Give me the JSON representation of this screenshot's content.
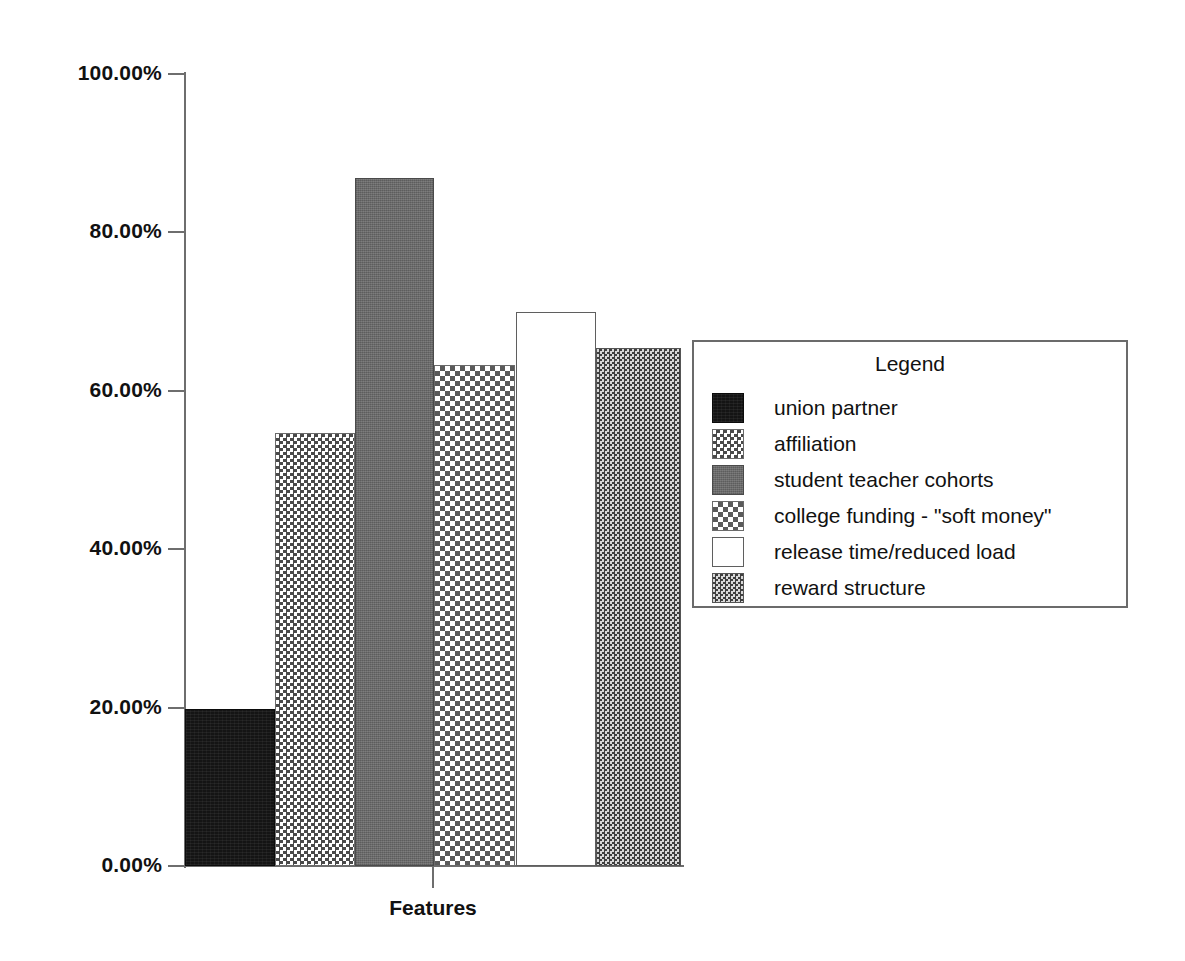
{
  "chart_data": {
    "type": "bar",
    "title": "",
    "xlabel": "Features",
    "ylabel": "% of PDSs",
    "ylim": [
      0,
      100
    ],
    "grid": false,
    "legend_position": "right",
    "legend_title": "Legend",
    "y_tick_labels": [
      "100.00%",
      "80.00%",
      "60.00%",
      "40.00%",
      "20.00%",
      "0.00%"
    ],
    "y_tick_values": [
      100,
      80,
      60,
      40,
      20,
      0
    ],
    "categories": [
      "union partner",
      "affiliation",
      "student teacher cohorts",
      "college funding - \"soft money\"",
      "release time/reduced load",
      "reward structure"
    ],
    "values": [
      19.8,
      54.7,
      86.9,
      63.3,
      69.9,
      65.4
    ],
    "value_labels": [
      "19.80%",
      "54.70%",
      "86.90%",
      "63.30%",
      "69.90%",
      "65.40%"
    ],
    "series": [
      {
        "name": "% of PDSs",
        "values": [
          19.8,
          54.7,
          86.9,
          63.3,
          69.9,
          65.4
        ]
      }
    ],
    "bars": [
      {
        "label": "union partner",
        "value": 19.8,
        "pattern": "solid-black",
        "swatch_class": "fill-solid-black",
        "left_pct": 0.0,
        "width_pct": 18.15
      },
      {
        "label": "affiliation",
        "value": 54.7,
        "pattern": "checker-medium",
        "swatch_class": "fill-check-medium",
        "left_pct": 18.15,
        "width_pct": 16.13
      },
      {
        "label": "student teacher cohorts",
        "value": 86.9,
        "pattern": "solid-gray",
        "swatch_class": "fill-solid-gray",
        "left_pct": 34.27,
        "width_pct": 15.93
      },
      {
        "label": "college funding - \"soft money\"",
        "value": 63.3,
        "pattern": "checker-open",
        "swatch_class": "fill-check-open",
        "left_pct": 50.2,
        "width_pct": 16.33
      },
      {
        "label": "release time/reduced load",
        "value": 69.9,
        "pattern": "white-outline",
        "swatch_class": "fill-white",
        "left_pct": 66.73,
        "width_pct": 16.13
      },
      {
        "label": "reward structure",
        "value": 65.4,
        "pattern": "checker-fine",
        "swatch_class": "fill-check-fine",
        "left_pct": 82.86,
        "width_pct": 17.14
      }
    ]
  },
  "legend": {
    "title": "Legend",
    "items": [
      {
        "label": "union partner",
        "swatch_class": "fill-solid-black",
        "swatch_name": "legend-swatch-solid-black"
      },
      {
        "label": "affiliation",
        "swatch_class": "fill-check-medium",
        "swatch_name": "legend-swatch-checker-medium"
      },
      {
        "label": "student teacher cohorts",
        "swatch_class": "fill-solid-gray",
        "swatch_name": "legend-swatch-solid-gray"
      },
      {
        "label": "college funding - \"soft money\"",
        "swatch_class": "fill-check-open",
        "swatch_name": "legend-swatch-checker-open"
      },
      {
        "label": "release time/reduced load",
        "swatch_class": "fill-white",
        "swatch_name": "legend-swatch-white"
      },
      {
        "label": "reward structure",
        "swatch_class": "fill-check-fine",
        "swatch_name": "legend-swatch-checker-fine"
      }
    ]
  },
  "colors": {
    "axis": "#6e6e6e",
    "text": "#111111",
    "background": "#ffffff",
    "bar_dark": "#141414",
    "bar_gray": "#707070"
  }
}
